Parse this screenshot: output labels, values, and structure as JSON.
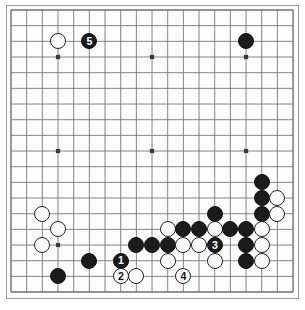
{
  "figure": {
    "board_size": 19,
    "board_label": "19x19 goban",
    "colors": {
      "board_background": "#fdfdfd",
      "board_border": "#9a9a9a",
      "grid_line": "#6f6f6f",
      "black_stone": "#1b1b1b",
      "white_stone": "#ffffff",
      "stone_outline": "#1f1f1f",
      "black_label_text": "#ffffff",
      "white_label_text": "#121212"
    },
    "geometry": {
      "origin_x": 11,
      "origin_y": 10,
      "spacing": 15.67,
      "stone_diameter": 16.2,
      "star_point_indices": [
        3,
        9,
        15
      ],
      "star_point_radius": 2.1
    }
  },
  "stones": [
    {
      "color": "white",
      "col": 3,
      "row": 2,
      "label": ""
    },
    {
      "color": "black",
      "col": 5,
      "row": 2,
      "label": "5"
    },
    {
      "color": "black",
      "col": 15,
      "row": 2,
      "label": ""
    },
    {
      "color": "black",
      "col": 16,
      "row": 11,
      "label": ""
    },
    {
      "color": "black",
      "col": 16,
      "row": 12,
      "label": ""
    },
    {
      "color": "white",
      "col": 17,
      "row": 12,
      "label": ""
    },
    {
      "color": "black",
      "col": 16,
      "row": 13,
      "label": ""
    },
    {
      "color": "white",
      "col": 17,
      "row": 13,
      "label": ""
    },
    {
      "color": "white",
      "col": 2,
      "row": 13,
      "label": ""
    },
    {
      "color": "black",
      "col": 13,
      "row": 13,
      "label": ""
    },
    {
      "color": "white",
      "col": 3,
      "row": 14,
      "label": ""
    },
    {
      "color": "white",
      "col": 10,
      "row": 14,
      "label": ""
    },
    {
      "color": "black",
      "col": 11,
      "row": 14,
      "label": ""
    },
    {
      "color": "black",
      "col": 12,
      "row": 14,
      "label": ""
    },
    {
      "color": "white",
      "col": 13,
      "row": 14,
      "label": ""
    },
    {
      "color": "black",
      "col": 14,
      "row": 14,
      "label": ""
    },
    {
      "color": "black",
      "col": 15,
      "row": 14,
      "label": ""
    },
    {
      "color": "white",
      "col": 16,
      "row": 14,
      "label": ""
    },
    {
      "color": "white",
      "col": 2,
      "row": 15,
      "label": ""
    },
    {
      "color": "black",
      "col": 8,
      "row": 15,
      "label": ""
    },
    {
      "color": "black",
      "col": 9,
      "row": 15,
      "label": ""
    },
    {
      "color": "black",
      "col": 10,
      "row": 15,
      "label": ""
    },
    {
      "color": "white",
      "col": 11,
      "row": 15,
      "label": ""
    },
    {
      "color": "white",
      "col": 12,
      "row": 15,
      "label": ""
    },
    {
      "color": "black",
      "col": 13,
      "row": 15,
      "label": "3"
    },
    {
      "color": "black",
      "col": 15,
      "row": 15,
      "label": ""
    },
    {
      "color": "white",
      "col": 16,
      "row": 15,
      "label": ""
    },
    {
      "color": "black",
      "col": 5,
      "row": 16,
      "label": ""
    },
    {
      "color": "black",
      "col": 7,
      "row": 16,
      "label": "1"
    },
    {
      "color": "white",
      "col": 10,
      "row": 16,
      "label": ""
    },
    {
      "color": "white",
      "col": 13,
      "row": 16,
      "label": ""
    },
    {
      "color": "black",
      "col": 15,
      "row": 16,
      "label": ""
    },
    {
      "color": "white",
      "col": 16,
      "row": 16,
      "label": ""
    },
    {
      "color": "black",
      "col": 3,
      "row": 17,
      "label": ""
    },
    {
      "color": "white",
      "col": 7,
      "row": 17,
      "label": "2"
    },
    {
      "color": "white",
      "col": 8,
      "row": 17,
      "label": ""
    },
    {
      "color": "white",
      "col": 11,
      "row": 17,
      "label": "4"
    }
  ],
  "move_sequence": [
    {
      "number": "1",
      "color": "black"
    },
    {
      "number": "2",
      "color": "white"
    },
    {
      "number": "3",
      "color": "black"
    },
    {
      "number": "4",
      "color": "white"
    },
    {
      "number": "5",
      "color": "black"
    }
  ]
}
